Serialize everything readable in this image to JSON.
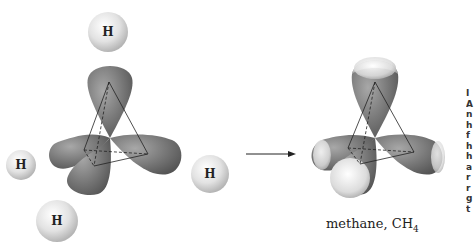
{
  "diagram": {
    "left_molecule": {
      "hydrogen_atoms": [
        "H",
        "H",
        "H",
        "H"
      ]
    },
    "arrow": "reaction-arrow",
    "right_molecule": {
      "caption_main": "methane, CH",
      "caption_sub": "4"
    },
    "clipped_margin_text": [
      "I",
      "A",
      "n",
      "h",
      "f",
      "h",
      "h",
      "a",
      "r",
      "r",
      "g",
      "t"
    ],
    "colors": {
      "orbital": "#6f6f6f",
      "orbital_light": "#bdbdbd",
      "hydrogen": "#e6e6e6",
      "background": "#ffffff"
    }
  }
}
